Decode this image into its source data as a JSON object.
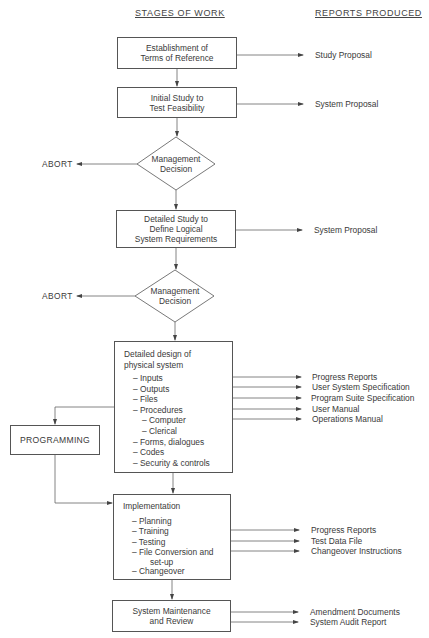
{
  "headers": {
    "stages": "STAGES OF WORK",
    "reports": "REPORTS PRODUCED"
  },
  "stages": {
    "terms_of_reference": {
      "lines": [
        "Establishment of",
        "Terms of Reference"
      ]
    },
    "initial_study": {
      "lines": [
        "Initial Study to",
        "Test Feasibility"
      ]
    },
    "decision_1": {
      "lines": [
        "Management",
        "Decision"
      ],
      "abort_label": "ABORT"
    },
    "detailed_study": {
      "lines": [
        "Detailed Study to",
        "Define Logical",
        "System Requirements"
      ]
    },
    "decision_2": {
      "lines": [
        "Management",
        "Decision"
      ],
      "abort_label": "ABORT"
    },
    "detailed_design": {
      "title_lines": [
        "Detailed design of",
        "physical system"
      ],
      "items": [
        "– Inputs",
        "– Outputs",
        "– Files",
        "– Procedures",
        "– Computer",
        "– Clerical",
        "– Forms, dialogues",
        "– Codes",
        "– Security & controls"
      ]
    },
    "programming": {
      "label": "PROGRAMMING"
    },
    "implementation": {
      "title": "Implementation",
      "items": [
        "– Planning",
        "– Training",
        "– Testing",
        "– File Conversion and",
        "set-up",
        "– Changeover"
      ]
    },
    "maintenance": {
      "lines": [
        "System Maintenance",
        "and Review"
      ]
    }
  },
  "reports": {
    "terms_of_reference": [
      "Study Proposal"
    ],
    "initial_study": [
      "System Proposal"
    ],
    "detailed_study": [
      "System Proposal"
    ],
    "detailed_design": [
      "Progress Reports",
      "User System Specification",
      "Program Suite Specification",
      "User Manual",
      "Operations Manual"
    ],
    "implementation": [
      "Progress Reports",
      "Test Data File",
      "Changeover Instructions"
    ],
    "maintenance": [
      "Amendment Documents",
      "System Audit Report"
    ]
  },
  "colors": {
    "line": "#555555",
    "text": "#3a3a3a"
  }
}
